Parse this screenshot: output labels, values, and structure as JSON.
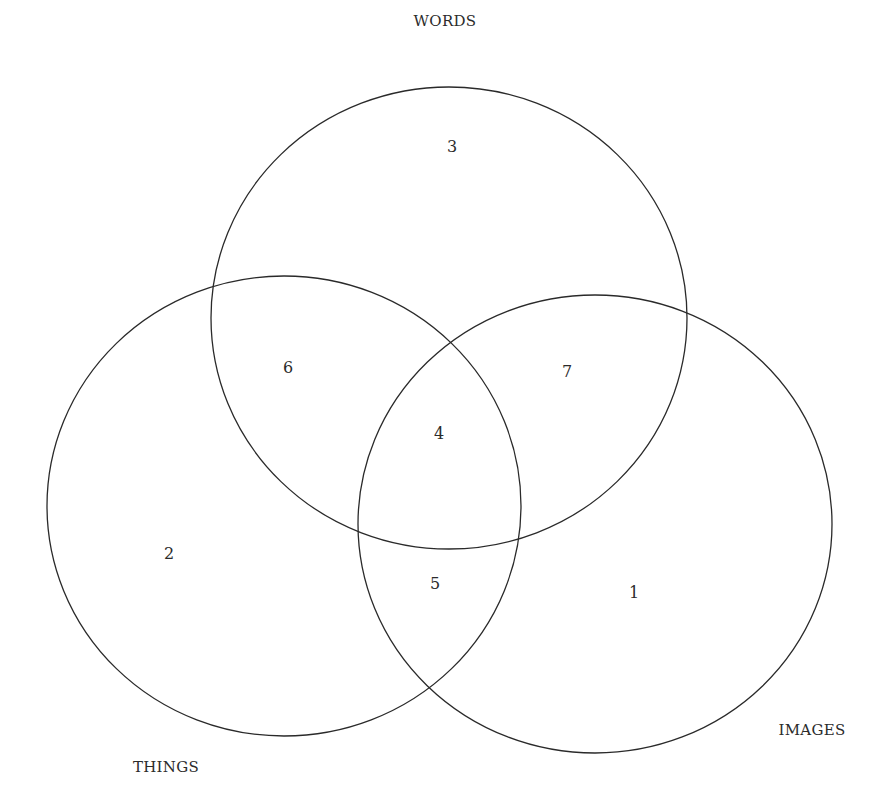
{
  "diagram": {
    "type": "venn",
    "stroke_color": "#2a2a2a",
    "background": "#ffffff",
    "sets": [
      {
        "name": "WORDS",
        "cx": 449,
        "cy": 318,
        "rx": 238,
        "ry": 231,
        "label_x": 445,
        "label_y": 21
      },
      {
        "name": "THINGS",
        "cx": 284,
        "cy": 506,
        "rx": 237,
        "ry": 230,
        "label_x": 166,
        "label_y": 767
      },
      {
        "name": "IMAGES",
        "cx": 595,
        "cy": 524,
        "rx": 237,
        "ry": 229,
        "label_x": 812,
        "label_y": 730
      }
    ],
    "regions": [
      {
        "id": "words-only",
        "value": "3",
        "x": 452,
        "y": 146
      },
      {
        "id": "things-only",
        "value": "2",
        "x": 169,
        "y": 553
      },
      {
        "id": "images-only",
        "value": "1",
        "x": 634,
        "y": 592
      },
      {
        "id": "words-things",
        "value": "6",
        "x": 288,
        "y": 367
      },
      {
        "id": "words-images",
        "value": "7",
        "x": 567,
        "y": 371
      },
      {
        "id": "things-images",
        "value": "5",
        "x": 435,
        "y": 583
      },
      {
        "id": "all-three",
        "value": "4",
        "x": 439,
        "y": 433
      }
    ]
  }
}
